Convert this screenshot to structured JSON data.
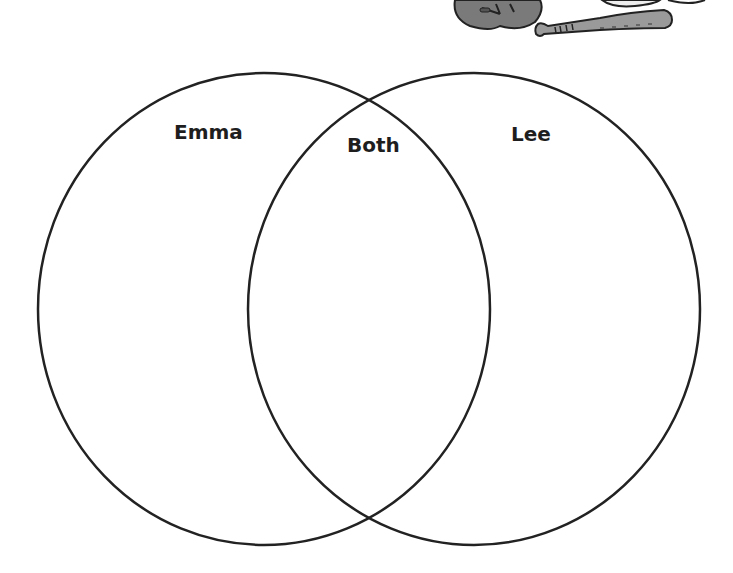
{
  "diagram": {
    "type": "venn",
    "sets": [
      {
        "label": "Emma",
        "center": [
          264,
          309
        ],
        "rx": 226,
        "ry": 236
      },
      {
        "label": "Lee",
        "center": [
          474,
          309
        ],
        "rx": 226,
        "ry": 236
      }
    ],
    "intersection_label": "Both",
    "stroke_color": "#222222"
  },
  "labels": {
    "left": "Emma",
    "middle": "Both",
    "right": "Lee"
  },
  "illustration": {
    "icons": [
      "baseball-glove-icon",
      "baseball-bat-icon",
      "baseball-icon"
    ]
  }
}
